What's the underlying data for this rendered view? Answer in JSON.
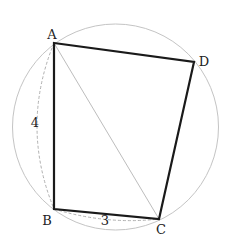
{
  "diagram": {
    "type": "cyclic-quadrilateral",
    "colors": {
      "circle": "#c4c4c4",
      "quad": "#1a1a1a",
      "diagonal": "#bdbdbd",
      "dashed_arc": "#b0b0b0",
      "label": "#222222"
    },
    "circle": {
      "cx": 115.5,
      "cy": 127,
      "r": 103
    },
    "points": {
      "A": {
        "x": 54,
        "y": 43,
        "label": "A",
        "lx": 52,
        "ly": 39
      },
      "B": {
        "x": 54,
        "y": 209,
        "label": "B",
        "lx": 47,
        "ly": 225
      },
      "C": {
        "x": 159,
        "y": 219,
        "label": "C",
        "lx": 161,
        "ly": 234
      },
      "D": {
        "x": 194,
        "y": 62,
        "label": "D",
        "lx": 204,
        "ly": 66
      }
    },
    "measures": {
      "AB": {
        "label": "4",
        "x": 35,
        "y": 127
      },
      "BC": {
        "label": "3",
        "x": 105,
        "y": 225
      }
    }
  }
}
